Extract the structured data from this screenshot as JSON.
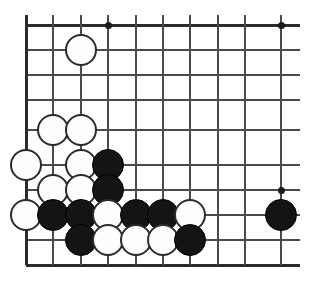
{
  "figure": {
    "kind": "go-board-diagram",
    "background_color": "#ffffff",
    "line_color": "#4a4a4a",
    "edge_color": "#2b2b2b",
    "black_stone_color": "#141414",
    "white_stone_color": "#fdfdfd",
    "white_stone_border_color": "#2b2b2b"
  },
  "board": {
    "visible_columns": 10,
    "visible_rows": 10,
    "column_x": [
      26,
      53,
      81,
      108,
      136,
      163,
      190,
      218,
      245,
      281
    ],
    "row_y": [
      25,
      50,
      75,
      100,
      130,
      165,
      190,
      215,
      240,
      265
    ],
    "cell_width": 27,
    "cell_height": 25,
    "stone_diameter": 32,
    "left_edge_x": 26,
    "bottom_edge_y": 265,
    "line_right_end_x": 300,
    "line_top_y": 25
  },
  "star_points": [
    {
      "name": "star-point-top-left",
      "col": 3,
      "row": 0
    },
    {
      "name": "star-point-top-right",
      "col": 9,
      "row": 0
    },
    {
      "name": "star-point-right",
      "col": 9,
      "row": 6
    }
  ],
  "stones": [
    {
      "name": "stone-white-c2-r1",
      "color": "white",
      "col": 2,
      "row": 1
    },
    {
      "name": "stone-white-c1-r4",
      "color": "white",
      "col": 1,
      "row": 4
    },
    {
      "name": "stone-white-c2-r4",
      "color": "white",
      "col": 2,
      "row": 4
    },
    {
      "name": "stone-white-c0-r5",
      "color": "white",
      "col": 0,
      "row": 5
    },
    {
      "name": "stone-white-c2-r5",
      "color": "white",
      "col": 2,
      "row": 5
    },
    {
      "name": "stone-black-c3-r5",
      "color": "black",
      "col": 3,
      "row": 5
    },
    {
      "name": "stone-white-c1-r6",
      "color": "white",
      "col": 1,
      "row": 6
    },
    {
      "name": "stone-white-c2-r6",
      "color": "white",
      "col": 2,
      "row": 6
    },
    {
      "name": "stone-black-c3-r6",
      "color": "black",
      "col": 3,
      "row": 6
    },
    {
      "name": "stone-white-c0-r7",
      "color": "white",
      "col": 0,
      "row": 7
    },
    {
      "name": "stone-black-c1-r7",
      "color": "black",
      "col": 1,
      "row": 7
    },
    {
      "name": "stone-black-c2-r7",
      "color": "black",
      "col": 2,
      "row": 7
    },
    {
      "name": "stone-white-c3-r7",
      "color": "white",
      "col": 3,
      "row": 7
    },
    {
      "name": "stone-black-c4-r7",
      "color": "black",
      "col": 4,
      "row": 7
    },
    {
      "name": "stone-black-c5-r7",
      "color": "black",
      "col": 5,
      "row": 7
    },
    {
      "name": "stone-white-c6-r7",
      "color": "white",
      "col": 6,
      "row": 7
    },
    {
      "name": "stone-black-c9-r7",
      "color": "black",
      "col": 9,
      "row": 7
    },
    {
      "name": "stone-black-c2-r8",
      "color": "black",
      "col": 2,
      "row": 8
    },
    {
      "name": "stone-white-c3-r8",
      "color": "white",
      "col": 3,
      "row": 8
    },
    {
      "name": "stone-white-c4-r8",
      "color": "white",
      "col": 4,
      "row": 8
    },
    {
      "name": "stone-white-c5-r8",
      "color": "white",
      "col": 5,
      "row": 8
    },
    {
      "name": "stone-black-c6-r8",
      "color": "black",
      "col": 6,
      "row": 8
    }
  ],
  "counts": {
    "black_stones": 10,
    "white_stones": 12,
    "total_stones": 22
  }
}
